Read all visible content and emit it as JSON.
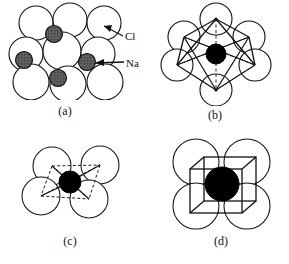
{
  "figure": {
    "background_color": "#ffffff",
    "line_color": "#111111",
    "cl_fill_color": "#ffffff",
    "na_fill_color": "#585858",
    "cation_fill_color": "#000000",
    "width": 289,
    "height": 264
  },
  "annotations": [
    {
      "name": "cl-label",
      "text": "Cl",
      "arrow": "points to large white sphere at upper right of panel a"
    },
    {
      "name": "na-label",
      "text": "Na",
      "arrow": "points to small dark sphere at mid right of panel a"
    }
  ],
  "labels": {
    "cl": "Cl",
    "na": "Na"
  },
  "panels": [
    {
      "id": "a",
      "caption": "(a)",
      "description": "Close-packed arrangement of large white Cl ions with small dark Na ions in octahedral interstices",
      "cl_sphere_count": 9,
      "na_sphere_count": 4
    },
    {
      "id": "b",
      "caption": "(b)",
      "description": "Octahedral coordination: six anions at the vertices of an octahedron around a central black cation",
      "anion_count": 6,
      "coordination_number": 6,
      "polyhedron": "octahedron"
    },
    {
      "id": "c",
      "caption": "(c)",
      "description": "Tetrahedral coordination: four anions around a small central black cation, tetrahedron shown dashed",
      "anion_count": 4,
      "coordination_number": 4,
      "polyhedron": "tetrahedron"
    },
    {
      "id": "d",
      "caption": "(d)",
      "description": "Cubic coordination: anions at cube corners around a large central black cation, cube shown in solid lines",
      "anion_count": 4,
      "coordination_number": 8,
      "polyhedron": "cube"
    }
  ]
}
